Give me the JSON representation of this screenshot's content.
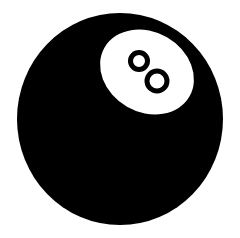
{
  "image": {
    "subject": "eight-ball",
    "label": "8"
  },
  "colors": {
    "background": "#ffffff",
    "ball": "#000000",
    "label_disc": "#ffffff",
    "numeral": "#000000"
  },
  "geometry": {
    "ball": {
      "cx": 120,
      "cy": 119,
      "rx": 103,
      "ry": 106
    },
    "label_disc": {
      "cx": 147,
      "cy": 72,
      "rx": 49,
      "ry": 40,
      "rotate": 30
    },
    "numeral_rings": [
      {
        "cx": 139,
        "cy": 61,
        "r": 8.5,
        "stroke": 5
      },
      {
        "cx": 157,
        "cy": 81,
        "r": 10,
        "stroke": 5
      }
    ]
  }
}
